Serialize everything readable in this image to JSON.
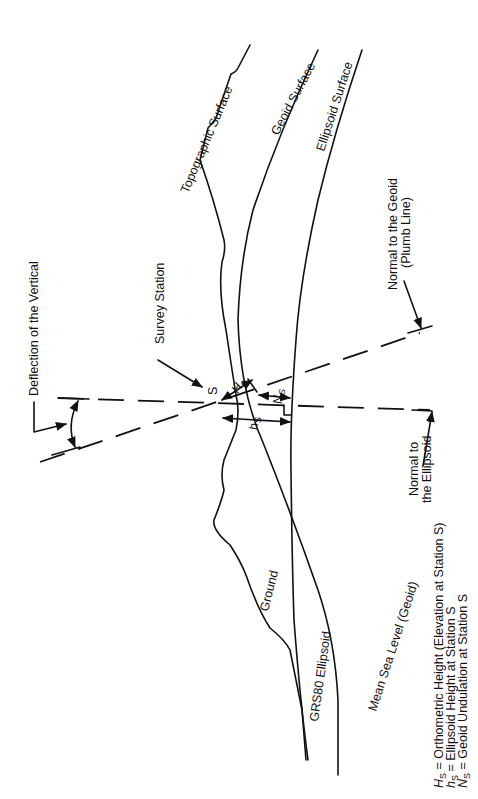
{
  "diagram": {
    "orientation": "rotated 90 degrees counter-clockwise",
    "colors": {
      "ink": "#111111",
      "background": "#ffffff"
    },
    "surfaces": {
      "topographic": "Topographic Surface",
      "geoid": "Geoid Surface",
      "ellipsoid": "Ellipsoid Surface",
      "ground": "Ground",
      "grs80": "GRS80 Ellipsoid",
      "msl": "Mean Sea Level (Geoid)"
    },
    "callouts": {
      "deflection": "Deflection of the Vertical",
      "survey_station": "Survey Station",
      "station_letter": "S",
      "normal_geoid_line1": "Normal to the Geoid",
      "normal_geoid_line2": "(Plumb Line)",
      "normal_ellipsoid_line1": "Normal to",
      "normal_ellipsoid_line2": "the Ellipsoid"
    },
    "measurements": {
      "H_main": "H",
      "h_main": "h",
      "N_main": "N",
      "sub": "S"
    },
    "legend": [
      {
        "symbol": "H",
        "sub": "S",
        "text": " = Orthometric Height (Elevation at Station S)"
      },
      {
        "symbol": "h",
        "sub": "S",
        "text": " = Ellipsoid Height at Station S"
      },
      {
        "symbol": "N",
        "sub": "S",
        "text": " = Geoid Undulation at Station S"
      }
    ]
  }
}
